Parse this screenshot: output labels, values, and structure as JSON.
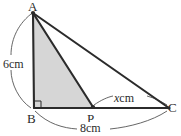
{
  "figure": {
    "background_color": "#ffffff",
    "stroke_color": "#2b2b2b",
    "arc_color": "#555555",
    "shade_color": "#d6d6d6",
    "vertices": {
      "A": {
        "label": "A",
        "x": 33,
        "y": 13
      },
      "B": {
        "label": "B",
        "x": 34,
        "y": 108
      },
      "P": {
        "label": "P",
        "x": 93,
        "y": 107
      },
      "C": {
        "label": "C",
        "x": 169,
        "y": 108
      }
    },
    "dimensions": [
      {
        "name": "side-AB",
        "label": "6cm",
        "value": "6",
        "unit": "cm",
        "from": "A",
        "to": "B"
      },
      {
        "name": "side-BC",
        "label": "8cm",
        "value": "8",
        "unit": "cm",
        "from": "B",
        "to": "C"
      },
      {
        "name": "side-PC",
        "label_math": "x",
        "label_unit": "cm",
        "value": "x",
        "unit": "cm",
        "from": "P",
        "to": "C"
      }
    ],
    "right_angle": {
      "at": "B",
      "marker": "square"
    },
    "shaded_region": {
      "name": "triangle-ABP",
      "vertices": [
        "A",
        "B",
        "P"
      ]
    },
    "segments": [
      {
        "name": "segment-AB",
        "from": "A",
        "to": "B"
      },
      {
        "name": "segment-AP",
        "from": "A",
        "to": "P"
      },
      {
        "name": "segment-AC",
        "from": "A",
        "to": "C"
      },
      {
        "name": "segment-BC",
        "from": "B",
        "to": "C"
      }
    ]
  }
}
